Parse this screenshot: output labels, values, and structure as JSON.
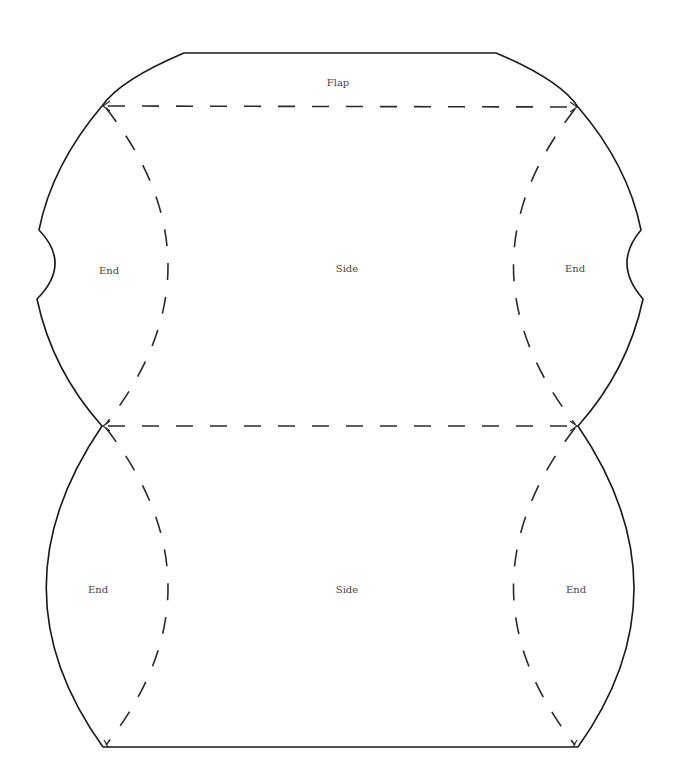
{
  "template": {
    "kind": "pillow-box-template",
    "line_color": "#1a1a1a",
    "label_color": "#444444",
    "background": "#ffffff"
  },
  "labels": {
    "flap": "Flap",
    "upper_left_end": "End",
    "upper_side": "Side",
    "upper_right_end": "End",
    "lower_left_end": "End",
    "lower_side": "Side",
    "lower_right_end": "End"
  },
  "legend": {
    "solid_line": "cut",
    "dashed_line": "fold"
  }
}
